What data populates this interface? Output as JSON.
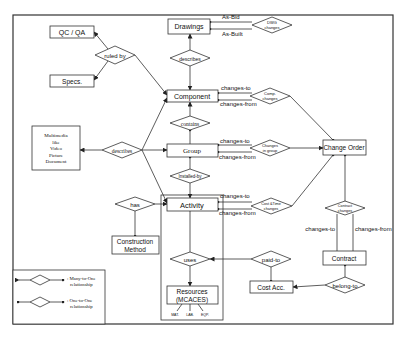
{
  "diagram": {
    "type": "entity-relationship",
    "entities": {
      "qcqa": "QC / QA",
      "specs": "Specs.",
      "drawings": "Drawings",
      "component": "Component",
      "group": "Group",
      "activity": "Activity",
      "multimedia": [
        "Multimedia",
        "like",
        "Video",
        "Picture",
        "Document"
      ],
      "construction_method": [
        "Construction",
        "Method"
      ],
      "resources": [
        "Resources",
        "(MCACES)"
      ],
      "resource_types": [
        "MAT.",
        "LAB.",
        "EQP."
      ],
      "change_order": "Change Order",
      "contract": "Contract",
      "cost_acc": "Cost Acc."
    },
    "relationships": {
      "ruled_by": "ruled by",
      "describes_top": "describes",
      "contains": "contains",
      "describes_left": "describes",
      "installed_by": "Installed-by",
      "has": "has",
      "uses": "uses",
      "dwg_changes": [
        "DWG",
        "changes"
      ],
      "comp_changes": [
        "Comp.",
        "changes"
      ],
      "changes_in_group": [
        "Changes",
        "in group"
      ],
      "cost_time_changes": [
        "Cost &Time",
        "changes"
      ],
      "contract_changes": [
        "Contract",
        "changes"
      ],
      "paid_to": "paid-to",
      "belong_to": "belong-to"
    },
    "edge_labels": {
      "as_bid": "As-Bid",
      "as_built": "As-Built",
      "comp_changes_to": "changes-to",
      "comp_changes_from": "changes-from",
      "group_changes_to": "changes-to",
      "group_changes_from": "changes-from",
      "activity_changes_to": "changes-to",
      "activity_changes_from": "changes-from",
      "contract_changes_to": "changes-to",
      "contract_changes_from": "changes-from"
    },
    "legend": {
      "many_to_one": [
        ": Many-to-One",
        "relationship"
      ],
      "one_to_one": [
        ": One-to-One",
        "relationship"
      ]
    }
  }
}
